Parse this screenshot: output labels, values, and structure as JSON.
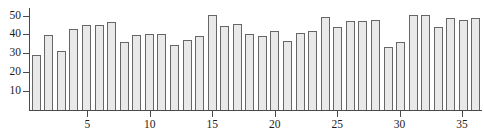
{
  "chart_data": {
    "type": "bar",
    "title": "",
    "subtitle": "",
    "xlabel": "",
    "ylabel": "",
    "grid": false,
    "legend": null,
    "xlim": [
      0.4,
      36.6
    ],
    "ylim": [
      0,
      54
    ],
    "yticks": [
      10,
      20,
      30,
      40,
      50
    ],
    "ytick_labels": [
      "10",
      "20",
      "30",
      "40",
      "50"
    ],
    "xticks": [
      5,
      10,
      15,
      20,
      25,
      30,
      35
    ],
    "xtick_labels": [
      "5",
      "10",
      "15",
      "20",
      "25",
      "30",
      "35"
    ],
    "categories": [
      1,
      2,
      3,
      4,
      5,
      6,
      7,
      8,
      9,
      10,
      11,
      12,
      13,
      14,
      15,
      16,
      17,
      18,
      19,
      20,
      21,
      22,
      23,
      24,
      25,
      26,
      27,
      28,
      29,
      30,
      31,
      32,
      33,
      34,
      35,
      36
    ],
    "values": [
      29.0,
      39.5,
      31.5,
      43.0,
      45.0,
      45.0,
      46.5,
      36.0,
      39.5,
      40.5,
      40.5,
      34.5,
      37.0,
      39.0,
      50.5,
      44.5,
      45.5,
      40.5,
      39.0,
      42.0,
      36.5,
      41.0,
      42.0,
      49.0,
      44.0,
      47.0,
      47.0,
      47.5,
      33.5,
      36.0,
      50.5,
      50.5,
      44.0,
      48.5,
      47.5,
      48.5
    ],
    "bar_fill_color": "#e9e9e9",
    "bar_edge_color": "#666666",
    "axis_color": "#4a4a4a",
    "background_color": "#ffffff"
  }
}
